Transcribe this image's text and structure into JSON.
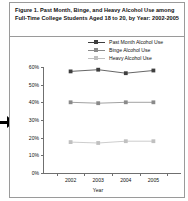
{
  "figure": {
    "title": "Figure 1. Past Month, Binge, and Heavy Alcohol Use among Full-Time College Students Aged 18 to 20, by Year: 2002-2005",
    "edge_arrow_icon": "right-arrow-pointer-icon"
  },
  "chart_data": {
    "type": "line",
    "title": "Figure 1. Past Month, Binge, and Heavy Alcohol Use among Full-Time College Students Aged 18 to 20, by Year: 2002-2005",
    "xlabel": "Year",
    "ylabel": "",
    "categories": [
      "2002",
      "2003",
      "2004",
      "2005"
    ],
    "x": [
      2002,
      2003,
      2004,
      2005
    ],
    "ylim": [
      0,
      60
    ],
    "ytick_labels": [
      "60%",
      "50%",
      "40%",
      "30%",
      "20%",
      "10%",
      "0%"
    ],
    "ytick_values": [
      60,
      50,
      40,
      30,
      20,
      10,
      0
    ],
    "grid": false,
    "legend_position": "top-right",
    "series": [
      {
        "name": "Past Month Alcohol Use",
        "values": [
          57.5,
          58.5,
          56.5,
          58.0
        ],
        "color": "#3f3f3f",
        "marker": "square"
      },
      {
        "name": "Binge Alcohol Use",
        "values": [
          40.0,
          39.5,
          40.0,
          40.0
        ],
        "color": "#8a8a8a",
        "marker": "square"
      },
      {
        "name": "Heavy Alcohol Use",
        "values": [
          17.5,
          17.0,
          18.0,
          18.0
        ],
        "color": "#c0c0c0",
        "marker": "square"
      }
    ]
  }
}
